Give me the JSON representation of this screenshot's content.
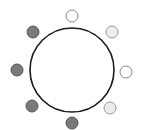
{
  "diagram": {
    "width": 143,
    "height": 130,
    "center_circle": {
      "cx": 72,
      "cy": 70,
      "r": 42,
      "fill": "#ffffff",
      "stroke": "#1a1a1a",
      "stroke_width": 1.6
    },
    "node_radius": 6,
    "styles": {
      "dark": {
        "fill": "#7a7a7a",
        "stroke": "#555555"
      },
      "light": {
        "fill": "#ececec",
        "stroke": "#999999"
      },
      "white": {
        "fill": "#ffffff",
        "stroke": "#888888"
      }
    },
    "nodes": [
      {
        "name": "node-top",
        "cx": 72,
        "cy": 16,
        "style": "white"
      },
      {
        "name": "node-top-right",
        "cx": 112,
        "cy": 32,
        "style": "light"
      },
      {
        "name": "node-right",
        "cx": 126,
        "cy": 72,
        "style": "white"
      },
      {
        "name": "node-bottom-right",
        "cx": 110,
        "cy": 108,
        "style": "light"
      },
      {
        "name": "node-bottom",
        "cx": 72,
        "cy": 123,
        "style": "dark"
      },
      {
        "name": "node-bottom-left",
        "cx": 32,
        "cy": 106,
        "style": "dark"
      },
      {
        "name": "node-left",
        "cx": 17,
        "cy": 70,
        "style": "dark"
      },
      {
        "name": "node-top-left",
        "cx": 33,
        "cy": 32,
        "style": "dark"
      }
    ]
  }
}
